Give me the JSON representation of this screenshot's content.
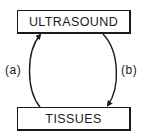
{
  "diagram": {
    "nodes": [
      {
        "id": "ultrasound",
        "label": "ULTRASOUND"
      },
      {
        "id": "tissues",
        "label": "TISSUES"
      }
    ],
    "edges": [
      {
        "id": "a",
        "label": "(a)",
        "from": "tissues",
        "to": "ultrasound",
        "side": "left"
      },
      {
        "id": "b",
        "label": "(b)",
        "from": "ultrasound",
        "to": "tissues",
        "side": "right"
      }
    ],
    "colors": {
      "stroke": "#1a1a1a",
      "background": "#ffffff"
    }
  }
}
